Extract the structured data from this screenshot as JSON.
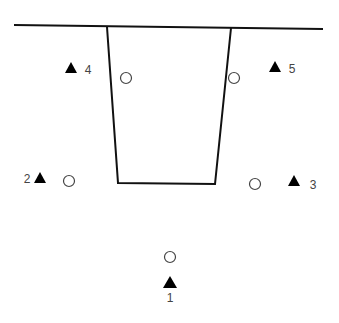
{
  "diagram": {
    "type": "site-plan-schematic",
    "colors": {
      "line": "#111111",
      "marker_fill": "#000000",
      "circle_stroke": "#444444",
      "label": "#444444",
      "background": "#ffffff"
    },
    "surface_line": {
      "x1": 14,
      "y1": 25,
      "x2": 323,
      "y2": 29
    },
    "trench": {
      "points": [
        [
          107,
          27
        ],
        [
          118,
          183
        ],
        [
          215,
          184
        ],
        [
          231,
          28
        ]
      ]
    },
    "stations": [
      {
        "id": "1",
        "label": "1",
        "triangle": {
          "cx": 170,
          "top": 276,
          "bottom": 288,
          "half": 7
        },
        "label_pos": {
          "x": 170,
          "y": 302,
          "anchor": "middle"
        }
      },
      {
        "id": "2",
        "label": "2",
        "triangle": {
          "cx": 40,
          "top": 172,
          "bottom": 183,
          "half": 6
        },
        "label_pos": {
          "x": 27,
          "y": 183,
          "anchor": "middle"
        }
      },
      {
        "id": "3",
        "label": "3",
        "triangle": {
          "cx": 294,
          "top": 175,
          "bottom": 186,
          "half": 6
        },
        "label_pos": {
          "x": 313,
          "y": 189,
          "anchor": "middle"
        }
      },
      {
        "id": "4",
        "label": "4",
        "triangle": {
          "cx": 71,
          "top": 62,
          "bottom": 73,
          "half": 6
        },
        "label_pos": {
          "x": 88,
          "y": 74,
          "anchor": "middle"
        }
      },
      {
        "id": "5",
        "label": "5",
        "triangle": {
          "cx": 275,
          "top": 61,
          "bottom": 72,
          "half": 6
        },
        "label_pos": {
          "x": 292,
          "y": 73,
          "anchor": "middle"
        }
      }
    ],
    "circles": [
      {
        "name": "circle-inner-left",
        "cx": 126,
        "cy": 78,
        "r": 5.5
      },
      {
        "name": "circle-inner-right",
        "cx": 234,
        "cy": 78,
        "r": 5.5
      },
      {
        "name": "circle-left",
        "cx": 69,
        "cy": 181,
        "r": 5.5
      },
      {
        "name": "circle-right",
        "cx": 255,
        "cy": 184,
        "r": 5.5
      },
      {
        "name": "circle-bottom",
        "cx": 170,
        "cy": 257,
        "r": 5.5
      }
    ]
  }
}
